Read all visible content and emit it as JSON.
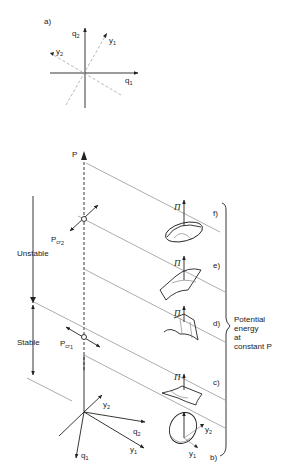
{
  "panel_a": {
    "label": "a)",
    "axes": {
      "q2": "q",
      "q2_sub": "2",
      "q1": "q",
      "q1_sub": "1",
      "y1": "y",
      "y1_sub": "1",
      "y2": "y",
      "y2_sub": "2"
    }
  },
  "main": {
    "p_axis": "P",
    "pcr2": "P",
    "pcr2_sub": "cr",
    "pcr2_sub2": "2",
    "pcr1": "P",
    "pcr1_sub": "cr",
    "pcr1_sub2": "1",
    "unstable": "Unstable",
    "stable": "Stable",
    "base_axes": {
      "q1": "q",
      "q1_sub": "1",
      "q2": "q",
      "q2_sub": "2",
      "y1": "y",
      "y1_sub": "1",
      "y2": "y",
      "y2_sub": "2"
    }
  },
  "surfaces": [
    {
      "label": "f)",
      "pi": "Π"
    },
    {
      "label": "e)",
      "pi": "Π"
    },
    {
      "label": "d)",
      "pi": "Π"
    },
    {
      "label": "c)",
      "pi": "Π"
    },
    {
      "label": "b)",
      "pi": "",
      "y1": "y",
      "y1_sub": "1",
      "y2": "y",
      "y2_sub": "2"
    }
  ],
  "brace_note": {
    "line1": "Potential",
    "line2": "energy",
    "line3": "at",
    "line4": "constant P"
  }
}
